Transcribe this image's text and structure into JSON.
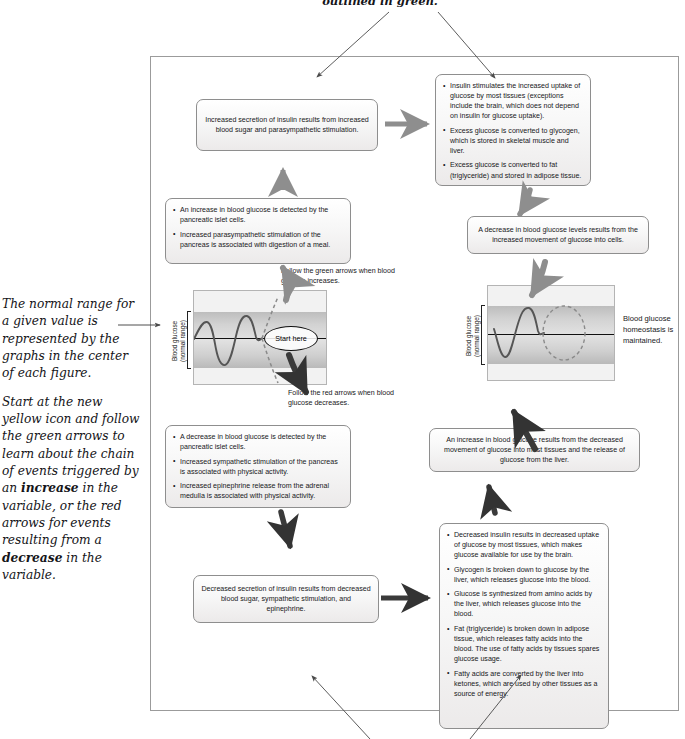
{
  "top_caption": "outlined in green.",
  "left_note": {
    "para1": "The normal range for a given value is represented by the graphs in the center of each figure.",
    "para2_a": "Start at the new yellow icon and follow the green arrows to learn about the chain of events triggered by an ",
    "para2_b": "increase",
    "para2_c": " in the variable, or the red arrows for events resulting from a ",
    "para2_d": "decrease",
    "para2_e": " in the variable."
  },
  "boxes": {
    "increased_insulin_secretion": "Increased secretion of insulin results from increased blood sugar and parasympathetic stimulation.",
    "insulin_effects": [
      "Insulin stimulates the increased uptake of glucose by most tissues (exceptions include the brain, which does not depend on insulin for glucose uptake).",
      "Excess glucose is converted to glycogen, which is stored in skeletal muscle and liver.",
      "Excess glucose is converted to fat (triglyceride) and stored in adipose tissue."
    ],
    "increase_detected": [
      "An increase in blood glucose is detected by the pancreatic islet cells.",
      "Increased parasympathetic stimulation of the pancreas is associated with digestion of a meal."
    ],
    "decrease_results": "A decrease in blood glucose levels results from the increased movement of glucose into cells.",
    "decrease_detected": [
      "A decrease in blood glucose is detected by the pancreatic islet cells.",
      "Increased sympathetic stimulation of the pancreas is associated with physical activity.",
      "Increased epinephrine release from the adrenal medulla is associated with physical activity."
    ],
    "increase_results": "An increase in blood glucose results from the decreased movement of glucose into most tissues and the release of glucose from the liver.",
    "decreased_insulin_secretion": "Decreased secretion of insulin results from decreased blood sugar, sympathetic stimulation, and epinephrine.",
    "decreased_insulin_effects": [
      "Decreased insulin results in decreased uptake of glucose by most tissues, which makes glucose available for use by the brain.",
      "Glycogen is broken down to glucose by the liver, which releases glucose into the blood.",
      "Glucose is synthesized from amino acids by the liver, which releases glucose into the blood.",
      "Fat (triglyceride) is broken down in adipose tissue, which releases fatty acids into the blood. The use of fatty acids by tissues spares glucose usage.",
      "Fatty acids are converted by the liver into ketones, which are used by other tissues as a source of energy."
    ]
  },
  "figures": {
    "left": {
      "axis_label_line1": "Blood glucose",
      "axis_label_line2": "(normal range)",
      "start_here": "Start here",
      "caption_green": "Follow the green arrows when blood glucose increases.",
      "caption_red": "Follow the red arrows when blood glucose decreases."
    },
    "right": {
      "axis_label_line1": "Blood glucose",
      "axis_label_line2": "(normal range)",
      "side_caption": "Blood glucose homeostasis is maintained."
    }
  },
  "colors": {
    "frame_border": "#9b9b9b",
    "box_border": "#8e8e8e",
    "arrow_gray": "#8e8e8e",
    "arrow_dark": "#3a3a3a",
    "thin_arrow": "#5a5a5a",
    "band_gray": "#cfcfcf",
    "curve": "#4a4a4a"
  }
}
